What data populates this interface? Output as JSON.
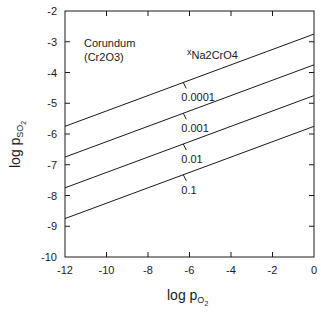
{
  "chart_data": {
    "type": "line",
    "title": "",
    "xlabel": "log p_O2",
    "xlabel_main": "log p",
    "xlabel_sub": "O",
    "xlabel_subsub": "2",
    "ylabel": "log p_SO2",
    "ylabel_main": "log p",
    "ylabel_sub": "SO",
    "ylabel_subsub": "2",
    "xlim": [
      -12,
      0
    ],
    "ylim": [
      -10,
      -2
    ],
    "xticks": [
      -12,
      -10,
      -8,
      -6,
      -4,
      -2,
      0
    ],
    "yticks": [
      -2,
      -3,
      -4,
      -5,
      -6,
      -7,
      -8,
      -9,
      -10
    ],
    "grid": false,
    "legend": "none (inline line labels)",
    "annotations": {
      "region_label_line1": "Corundum",
      "region_label_line2": "(Cr2O3)",
      "param_label_x": "x",
      "param_label_sub": "Na2CrO4"
    },
    "series": [
      {
        "name": "0.0001",
        "x": [
          -12,
          0
        ],
        "y": [
          -5.75,
          -2.75
        ]
      },
      {
        "name": "0.001",
        "x": [
          -12,
          0
        ],
        "y": [
          -6.75,
          -3.75
        ]
      },
      {
        "name": "0.01",
        "x": [
          -12,
          0
        ],
        "y": [
          -7.75,
          -4.75
        ]
      },
      {
        "name": "0.1",
        "x": [
          -12,
          0
        ],
        "y": [
          -8.75,
          -5.75
        ]
      }
    ],
    "colors": {
      "line": "#1a1a1a",
      "axis": "#1a1a1a",
      "background": "#ffffff"
    }
  }
}
